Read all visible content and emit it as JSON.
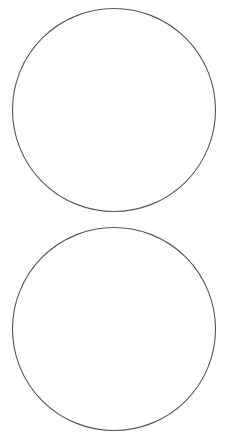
{
  "diagram": {
    "shapes": [
      {
        "id": "circle-top",
        "type": "circle",
        "label": ""
      },
      {
        "id": "circle-bottom",
        "type": "circle",
        "label": ""
      }
    ],
    "colors": {
      "background": "#ffffff",
      "stroke": "#555555",
      "fill": "#ffffff"
    }
  }
}
